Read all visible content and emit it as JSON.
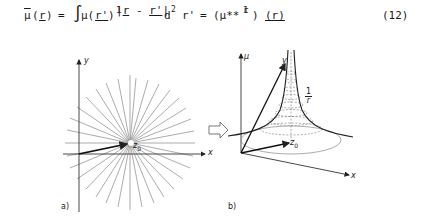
{
  "equation": {
    "lhs_mu": "μ",
    "lhs_arg": "r",
    "equals1": "=",
    "integral": "∫",
    "mu": "μ(",
    "r_prime": "r'",
    "close": ")",
    "frac_num": "1",
    "frac_den_r": "r",
    "frac_den_minus": "-",
    "frac_den_rprime": "r'",
    "d2": "d",
    "exp2": "2",
    "r_prime2": "r'",
    "equals2": "=",
    "conv_open": "(μ**",
    "conv_frac_num": "1",
    "conv_frac_den": "r",
    "conv_close": ")",
    "conv_arg": "(r)",
    "number": "(12)"
  },
  "figure_a": {
    "label": "a)",
    "x_axis": "x",
    "y_axis": "y",
    "point": "z",
    "point_sub": "0"
  },
  "transition_arrow": "⇨",
  "figure_b": {
    "label": "b)",
    "mu_axis": "μ",
    "x_axis": "x",
    "y_axis": "y",
    "curve_label_num": "1",
    "curve_label_den": "r",
    "point": "z",
    "point_sub": "0"
  }
}
